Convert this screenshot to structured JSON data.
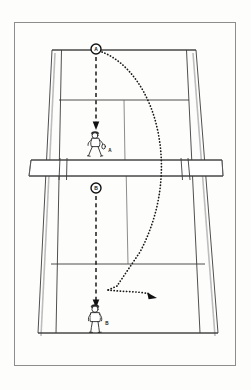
{
  "diagram": {
    "type": "tennis-court-perspective",
    "frame": {
      "x": 14,
      "y": 22,
      "width": 222,
      "height": 344
    },
    "court": {
      "description": "Tennis court drawn in perspective, narrow at the far baseline and wide at the near baseline, with doubles alleys, service boxes, center service line and a net band crossing the middle.",
      "far_baseline_y": 50,
      "near_baseline_y": 333,
      "net_y": 163
    },
    "markers": [
      {
        "name": "marker-a",
        "label": "A",
        "cx": 96,
        "cy": 49,
        "r": 5.0,
        "description": "Ball position marker at far baseline"
      },
      {
        "name": "marker-b",
        "label": "B",
        "cx": 96,
        "cy": 188,
        "r": 5.0,
        "description": "Ball position marker just past the net on near side"
      }
    ],
    "players": [
      {
        "name": "player-a",
        "label": "A",
        "x": 96,
        "y": 142,
        "side": "far",
        "posture": "ready-crouch",
        "label_x": 110,
        "label_y": 151
      },
      {
        "name": "player-b",
        "label": "B",
        "x": 96,
        "y": 318,
        "side": "near",
        "posture": "standing",
        "label_x": 107,
        "label_y": 324
      }
    ],
    "paths": [
      {
        "name": "dashed-path-top",
        "style": "dashed",
        "from": [
          96,
          56
        ],
        "to": [
          96,
          126
        ],
        "arrow": true,
        "description": "Straight dashed movement line from marker A down toward player A"
      },
      {
        "name": "dashed-path-bottom",
        "style": "dashed",
        "from": [
          96,
          195
        ],
        "to": [
          96,
          303
        ],
        "arrow": true,
        "description": "Straight dashed movement line from marker B down toward player B"
      },
      {
        "name": "dotted-ball-arc",
        "style": "dotted",
        "description": "Curved dotted ball flight from marker A arcing right and down, bouncing and hooking to a final arrowhead",
        "arrow": true,
        "arrow_at": [
          155,
          296
        ]
      }
    ],
    "legend_notes": {
      "dashed": "player movement",
      "dotted": "ball trajectory",
      "circle": "ball position"
    }
  }
}
